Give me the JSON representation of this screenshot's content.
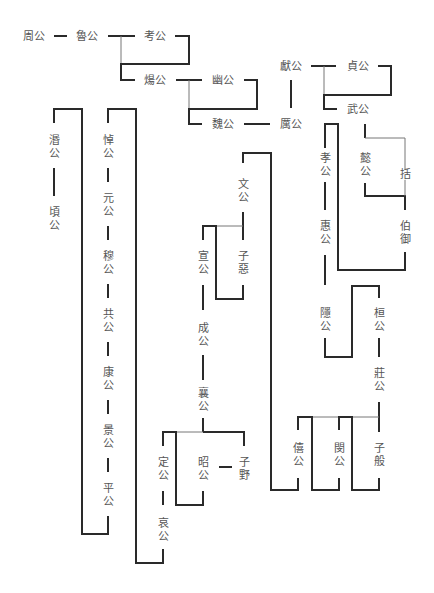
{
  "nodes": {
    "zhougong": "周公",
    "lugong": "魯公",
    "kaogong": "考公",
    "yanggong": "煬公",
    "yougong": "幽公",
    "weigong": "魏公",
    "ligong": "厲公",
    "xiangong": "獻公",
    "zhengong": "貞公",
    "wugong": "武公",
    "xiaogong": "孝公",
    "yigong": "懿公",
    "kuo": "括",
    "boyu": "伯御",
    "huigong": "惠公",
    "yingong": "隱公",
    "huangong": "桓公",
    "zhuanggong": "莊公",
    "xigong": "僖公",
    "mingong": "閔公",
    "ziban": "子般",
    "wengong": "文公",
    "xuangong": "宣公",
    "ziwu": "子惡",
    "chenggong": "成公",
    "xianggong": "襄公",
    "dinggong": "定公",
    "zhaogong": "昭公",
    "ziye": "子野",
    "aigong": "哀公",
    "daogong": "悼公",
    "yuangong": "元公",
    "mugong": "穆公",
    "gonggong": "共公",
    "kanggong": "康公",
    "jinggong": "景公",
    "pinggong": "平公",
    "mingong2": "湣公",
    "qinggong": "頃公"
  }
}
